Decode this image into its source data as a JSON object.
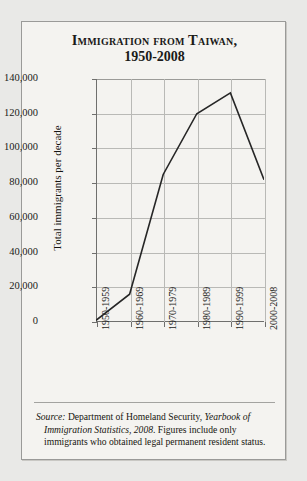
{
  "figure": {
    "title_line1": "Immigration from Taiwan,",
    "title_line2": "1950-2008",
    "background_color": "#f4f3f0",
    "border_color": "#9a9a98",
    "line_color": "#262626"
  },
  "source_note": {
    "label": "Source:",
    "text_before_italic": " Department of Homeland Security, ",
    "italic_title": "Yearbook of Immigration Statistics, 2008",
    "text_after_italic": ". Figures include only immigrants who obtained legal permanent resident status."
  },
  "chart_data": {
    "type": "line",
    "title": "Immigration from Taiwan, 1950-2008",
    "xlabel": "",
    "ylabel": "Total immigrants per decade",
    "categories": [
      "1950-1959",
      "1960-1969",
      "1970-1979",
      "1980-1989",
      "1990-1999",
      "2000-2008"
    ],
    "values": [
      1000,
      16000,
      85000,
      120000,
      132000,
      82000
    ],
    "ylim": [
      0,
      140000
    ],
    "ytick_values": [
      0,
      20000,
      40000,
      60000,
      80000,
      100000,
      120000,
      140000
    ],
    "ytick_labels": [
      "0",
      "20,000",
      "40,000",
      "60,000",
      "80,000",
      "100,000",
      "120,000",
      "140,000"
    ],
    "grid": true,
    "legend": false,
    "legend_position": "none",
    "series": [
      {
        "name": "Total immigrants per decade",
        "values": [
          1000,
          16000,
          85000,
          120000,
          132000,
          82000
        ]
      }
    ]
  }
}
